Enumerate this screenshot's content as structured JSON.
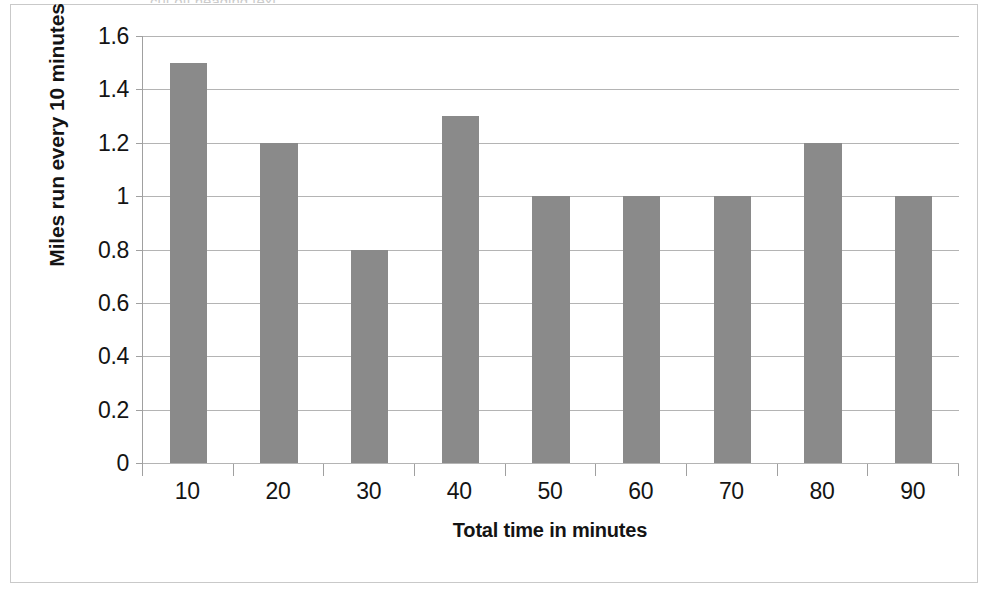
{
  "chart_data": {
    "type": "bar",
    "title": "",
    "categories": [
      "10",
      "20",
      "30",
      "40",
      "50",
      "60",
      "70",
      "80",
      "90"
    ],
    "values": [
      1.5,
      1.2,
      0.8,
      1.3,
      1.0,
      1.0,
      1.0,
      1.2,
      1.0
    ],
    "xlabel": "Total time in minutes",
    "ylabel": "Miles run every 10 minutes",
    "ylim": [
      0,
      1.6
    ],
    "y_ticks": [
      "0",
      "0.2",
      "0.4",
      "0.6",
      "0.8",
      "1",
      "1.2",
      "1.4",
      "1.6"
    ],
    "y_tick_values": [
      0,
      0.2,
      0.4,
      0.6,
      0.8,
      1,
      1.2,
      1.4,
      1.6
    ],
    "grid": true,
    "legend": "none",
    "bar_color": "#8a8a8a",
    "gridline_color": "#b4b4b4",
    "axis_color": "#a0a0a0",
    "border_color": "#c9c9c9"
  },
  "axes": {
    "y_title": "Miles run every 10 minutes",
    "x_title": "Total time in minutes"
  },
  "top_crop_sliver": "cut off heading text"
}
